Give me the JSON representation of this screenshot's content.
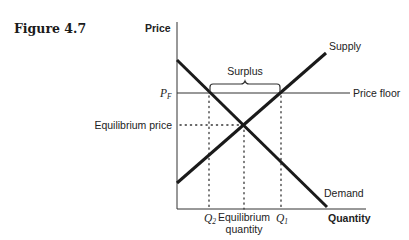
{
  "figure": {
    "title": "Figure 4.7"
  },
  "axes": {
    "y_label": "Price",
    "x_label": "Quantity",
    "origin": [
      177,
      209
    ],
    "y_top": 22,
    "x_right": 366
  },
  "curves": {
    "supply": {
      "label": "Supply",
      "from": [
        177,
        183
      ],
      "to": [
        326,
        53
      ]
    },
    "demand": {
      "label": "Demand",
      "from": [
        177,
        60
      ],
      "to": [
        327,
        207
      ]
    },
    "price_floor": {
      "label": "Price floor",
      "y": 93,
      "x_end": 350
    }
  },
  "annotations": {
    "pf_label": "P",
    "pf_sub": "F",
    "equilibrium_price": "Equilibrium price",
    "equilibrium_quantity_line1": "Equilibrium",
    "equilibrium_quantity_line2": "quantity",
    "q2_label": "Q",
    "q2_sub": "2",
    "q1_label": "Q",
    "q1_sub": "1",
    "surplus": "Surplus"
  },
  "points": {
    "equilibrium": [
      244,
      125
    ],
    "q2_at_floor": [
      209,
      93
    ],
    "q1_at_floor": [
      281,
      93
    ]
  },
  "colors": {
    "curve": "#1a1a1a",
    "axis": "#333333",
    "dotted": "#333333"
  }
}
